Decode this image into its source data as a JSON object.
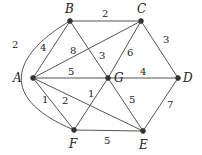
{
  "diagram": {
    "type": "weighted-undirected-graph",
    "nodes": [
      {
        "id": "A",
        "label": "A",
        "x": 33,
        "y": 78,
        "lx": 13,
        "ly": 82
      },
      {
        "id": "B",
        "label": "B",
        "x": 70,
        "y": 21,
        "lx": 65,
        "ly": 13
      },
      {
        "id": "C",
        "label": "C",
        "x": 141,
        "y": 21,
        "lx": 137,
        "ly": 13
      },
      {
        "id": "D",
        "label": "D",
        "x": 178,
        "y": 78,
        "lx": 183,
        "ly": 82
      },
      {
        "id": "G",
        "label": "G",
        "x": 108,
        "y": 78,
        "lx": 114,
        "ly": 82
      },
      {
        "id": "F",
        "label": "F",
        "x": 74,
        "y": 130,
        "lx": 69,
        "ly": 148
      },
      {
        "id": "E",
        "label": "E",
        "x": 143,
        "y": 131,
        "lx": 139,
        "ly": 149
      }
    ],
    "edges": [
      {
        "from": "B",
        "to": "C",
        "weight": "2",
        "wx": 102,
        "wy": 17
      },
      {
        "from": "A",
        "to": "B",
        "weight": "4",
        "wx": 40,
        "wy": 51
      },
      {
        "from": "B",
        "to": "F",
        "weight": "2",
        "curved": true,
        "wx": 12,
        "wy": 48
      },
      {
        "from": "A",
        "to": "C",
        "weight": "8",
        "wx": 70,
        "wy": 54
      },
      {
        "from": "B",
        "to": "G",
        "weight": "3",
        "wx": 99,
        "wy": 59
      },
      {
        "from": "C",
        "to": "G",
        "weight": "6",
        "wx": 127,
        "wy": 56
      },
      {
        "from": "C",
        "to": "D",
        "weight": "3",
        "wx": 163,
        "wy": 43
      },
      {
        "from": "A",
        "to": "G",
        "weight": "5",
        "wx": 68,
        "wy": 75
      },
      {
        "from": "G",
        "to": "D",
        "weight": "4",
        "wx": 140,
        "wy": 75
      },
      {
        "from": "A",
        "to": "F",
        "weight": "1",
        "wx": 42,
        "wy": 103
      },
      {
        "from": "A",
        "to": "E",
        "weight": "2",
        "wx": 62,
        "wy": 104
      },
      {
        "from": "G",
        "to": "F",
        "weight": "1",
        "wx": 88,
        "wy": 97
      },
      {
        "from": "G",
        "to": "E",
        "weight": "5",
        "wx": 129,
        "wy": 103
      },
      {
        "from": "D",
        "to": "E",
        "weight": "7",
        "wx": 167,
        "wy": 108
      },
      {
        "from": "F",
        "to": "E",
        "weight": "5",
        "wx": 104,
        "wy": 144
      }
    ]
  }
}
